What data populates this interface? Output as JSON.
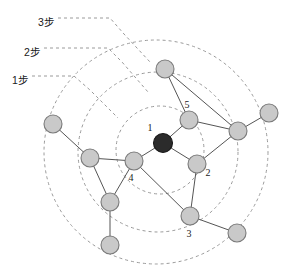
{
  "figure": {
    "background_color": "#ffffff",
    "width": 288,
    "height": 271
  },
  "ring_labels": [
    {
      "id": "hop3",
      "text": "3步",
      "x": 38,
      "y": 14,
      "hops": 3
    },
    {
      "id": "hop2",
      "text": "2步",
      "x": 24,
      "y": 44,
      "hops": 2
    },
    {
      "id": "hop1",
      "text": "1步",
      "x": 12,
      "y": 72,
      "hops": 1
    }
  ],
  "rings": [
    {
      "id": "ring1",
      "label": "1步",
      "cx": 160,
      "cy": 150,
      "r": 44
    },
    {
      "id": "ring2",
      "label": "2步",
      "cx": 158,
      "cy": 152,
      "r": 80
    },
    {
      "id": "ring3",
      "label": "3步",
      "cx": 156,
      "cy": 152,
      "r": 112
    }
  ],
  "leaders": [
    {
      "id": "leader-hop3",
      "path": "M 58 18 L 110 18 L 124 34 L 150 62"
    },
    {
      "id": "leader-hop2",
      "path": "M 44 48 L 108 48 L 122 62 L 148 92"
    },
    {
      "id": "leader-hop1",
      "path": "M 32 76 L 74 76 L 90 90 L 118 118"
    }
  ],
  "nodes": [
    {
      "id": "n1",
      "label": "1",
      "x": 163,
      "y": 143,
      "r": 9.5,
      "color": "dark",
      "label_dx": -13,
      "label_dy": -12
    },
    {
      "id": "n5",
      "label": "5",
      "x": 189,
      "y": 120,
      "r": 9,
      "color": "gray",
      "label_dx": -2,
      "label_dy": -12
    },
    {
      "id": "n2",
      "label": "2",
      "x": 197,
      "y": 164,
      "r": 9,
      "color": "gray",
      "label_dx": 11,
      "label_dy": 12
    },
    {
      "id": "n4",
      "label": "4",
      "x": 134,
      "y": 161,
      "r": 9,
      "color": "gray",
      "label_dx": -3,
      "label_dy": 20
    },
    {
      "id": "n3",
      "label": "3",
      "x": 190,
      "y": 216,
      "r": 9,
      "color": "gray",
      "label_dx": -1,
      "label_dy": 21
    },
    {
      "id": "nTop",
      "label": "",
      "x": 165,
      "y": 69,
      "r": 9,
      "color": "gray"
    },
    {
      "id": "nRight",
      "label": "",
      "x": 238,
      "y": 131,
      "r": 9,
      "color": "gray"
    },
    {
      "id": "nFarRight",
      "label": "",
      "x": 269,
      "y": 113,
      "r": 9,
      "color": "gray"
    },
    {
      "id": "nFarLeft",
      "label": "",
      "x": 53,
      "y": 124,
      "r": 9,
      "color": "gray"
    },
    {
      "id": "nLeftMid",
      "label": "",
      "x": 90,
      "y": 158,
      "r": 9,
      "color": "gray"
    },
    {
      "id": "nLowLeft",
      "label": "",
      "x": 110,
      "y": 202,
      "r": 9,
      "color": "gray"
    },
    {
      "id": "nBotLeft",
      "label": "",
      "x": 110,
      "y": 245,
      "r": 9,
      "color": "gray"
    },
    {
      "id": "nBotRight",
      "label": "",
      "x": 237,
      "y": 233,
      "r": 9,
      "color": "gray"
    }
  ],
  "edges": [
    {
      "from": "n1",
      "to": "n5"
    },
    {
      "from": "n1",
      "to": "n2"
    },
    {
      "from": "n1",
      "to": "n4"
    },
    {
      "from": "n5",
      "to": "nTop"
    },
    {
      "from": "n5",
      "to": "nRight"
    },
    {
      "from": "nTop",
      "to": "nRight"
    },
    {
      "from": "nRight",
      "to": "nFarRight"
    },
    {
      "from": "nRight",
      "to": "n2"
    },
    {
      "from": "n2",
      "to": "n3"
    },
    {
      "from": "n3",
      "to": "n4"
    },
    {
      "from": "n3",
      "to": "nBotRight"
    },
    {
      "from": "n4",
      "to": "nLeftMid"
    },
    {
      "from": "n4",
      "to": "nLowLeft"
    },
    {
      "from": "nLeftMid",
      "to": "nFarLeft"
    },
    {
      "from": "nLeftMid",
      "to": "nLowLeft"
    },
    {
      "from": "nLowLeft",
      "to": "nBotLeft"
    }
  ],
  "colors": {
    "node_gray_fill": "#c9c9c9",
    "node_gray_stroke": "#7a7a7a",
    "node_dark_fill": "#2b2b2b",
    "edge": "#555555",
    "ring": "#9a9a9a",
    "text": "#1a1a1a"
  }
}
